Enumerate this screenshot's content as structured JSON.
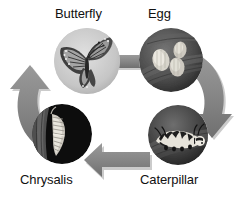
{
  "diagram": {
    "background_color": "#ffffff",
    "arrow_color": "#808080",
    "arrow_shadow_color": "#b4b4b4",
    "label_color": "#111111",
    "direction": "clockwise",
    "stages": [
      {
        "id": "butterfly",
        "label": "Butterfly",
        "label_position": "above",
        "photo": "butterfly-photo",
        "photo_description": "Monarch butterfly with open wings on pale gray background",
        "position": "top-left"
      },
      {
        "id": "egg",
        "label": "Egg",
        "label_position": "above",
        "photo": "egg-photo",
        "photo_description": "Pale eggs clustered on a dark leaf",
        "position": "top-right"
      },
      {
        "id": "caterpillar",
        "label": "Caterpillar",
        "label_position": "below",
        "photo": "caterpillar-photo",
        "photo_description": "Striped monarch caterpillar on a dark leaf",
        "position": "bottom-right"
      },
      {
        "id": "chrysalis",
        "label": "Chrysalis",
        "label_position": "below",
        "photo": "chrysalis-photo",
        "photo_description": "Ribbed chrysalis hanging against a black background",
        "position": "bottom-left"
      }
    ],
    "connectors": [
      {
        "id": "butterfly-to-egg",
        "from": "butterfly",
        "to": "egg",
        "shape": "straight-bar",
        "points": "right"
      },
      {
        "id": "egg-to-caterpillar",
        "from": "egg",
        "to": "caterpillar",
        "shape": "curved-arrow",
        "points": "down-right"
      },
      {
        "id": "caterpillar-to-chrysalis",
        "from": "caterpillar",
        "to": "chrysalis",
        "shape": "straight-arrow",
        "points": "left"
      },
      {
        "id": "chrysalis-to-butterfly",
        "from": "chrysalis",
        "to": "butterfly",
        "shape": "curved-arrow",
        "points": "up-right"
      }
    ]
  }
}
